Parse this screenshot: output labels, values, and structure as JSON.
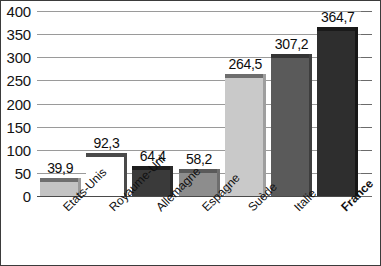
{
  "chart_data": {
    "type": "bar",
    "title": "",
    "subtitle": "",
    "xlabel": "",
    "ylabel": "",
    "ylim": [
      0,
      400
    ],
    "ytick_step": 50,
    "yticks": [
      "400",
      "350",
      "300",
      "250",
      "200",
      "150",
      "100",
      "50",
      "0"
    ],
    "ytick_values": [
      400,
      350,
      300,
      250,
      200,
      150,
      100,
      50,
      0
    ],
    "grid": true,
    "legend": false,
    "legend_position": "none",
    "decimal_separator": ",",
    "categories": [
      "Etats-Unis",
      "Royaume-Uni",
      "Allemagne",
      "Espagne",
      "Suède",
      "Italie",
      "France"
    ],
    "values": [
      39.9,
      92.3,
      64.4,
      58.2,
      264.5,
      307.2,
      364.7
    ],
    "value_labels": [
      "39,9",
      "92,3",
      "64,4",
      "58,2",
      "264,5",
      "307,2",
      "364,7"
    ],
    "bar_colors": [
      "#c3c3c3",
      "#ffffff",
      "#3a3a3a",
      "#8d8d8d",
      "#c9c9c9",
      "#5a5a5a",
      "#2e2e2e"
    ],
    "bar_cap_colors": [
      "#6e6e6e",
      "#4a4a4a",
      "#1d1d1d",
      "#5a5a5a",
      "#6e6e6e",
      "#343434",
      "#1a1a1a"
    ],
    "bar_side_colors": [
      "#9a9a9a",
      "#4a4a4a",
      "#2a2a2a",
      "#6e6e6e",
      "#9e9e9e",
      "#3e3e3e",
      "#171717"
    ],
    "emphasized_category": "France",
    "bars": [
      {
        "category": "Etats-Unis",
        "value": 39.9,
        "label": "39,9",
        "color": "#c3c3c3",
        "emphasized": false
      },
      {
        "category": "Royaume-Uni",
        "value": 92.3,
        "label": "92,3",
        "color": "#ffffff",
        "emphasized": false
      },
      {
        "category": "Allemagne",
        "value": 64.4,
        "label": "64,4",
        "color": "#3a3a3a",
        "emphasized": false
      },
      {
        "category": "Espagne",
        "value": 58.2,
        "label": "58,2",
        "color": "#8d8d8d",
        "emphasized": false
      },
      {
        "category": "Suède",
        "value": 264.5,
        "label": "264,5",
        "color": "#c9c9c9",
        "emphasized": false
      },
      {
        "category": "Italie",
        "value": 307.2,
        "label": "307,2",
        "color": "#5a5a5a",
        "emphasized": false
      },
      {
        "category": "France",
        "value": 364.7,
        "label": "364,7",
        "color": "#2e2e2e",
        "emphasized": true
      }
    ]
  },
  "colors": {
    "background": "#ffffff",
    "frame": "#3b3b3b",
    "gridline": "#9a9a9a",
    "baseline": "#4a4a4a",
    "text": "#111111"
  }
}
